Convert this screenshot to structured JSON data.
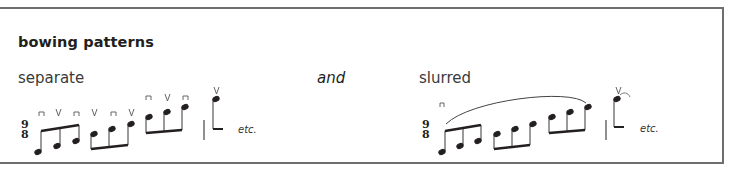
{
  "section": {
    "title": "bowing patterns",
    "left_label": "separate",
    "connector": "and",
    "right_label": "slurred",
    "etc_label": "etc."
  },
  "time_signature": {
    "top": "9",
    "bottom": "8"
  },
  "colors": {
    "border": "#6e6e6e",
    "ink": "#231f20",
    "label": "#3a3a3a"
  },
  "separate_example": {
    "groups": [
      {
        "bowings": [
          "down-bow",
          "up-bow",
          "down-bow"
        ]
      },
      {
        "bowings": [
          "up-bow",
          "down-bow",
          "up-bow"
        ]
      },
      {
        "bowings": [
          "down-bow",
          "up-bow",
          "down-bow"
        ]
      }
    ],
    "final_note_bowing": "up-bow"
  },
  "slurred_example": {
    "first_bowing": "down-bow",
    "slur": "over all 9 eighth notes",
    "final_note_bowing": "up-bow"
  }
}
